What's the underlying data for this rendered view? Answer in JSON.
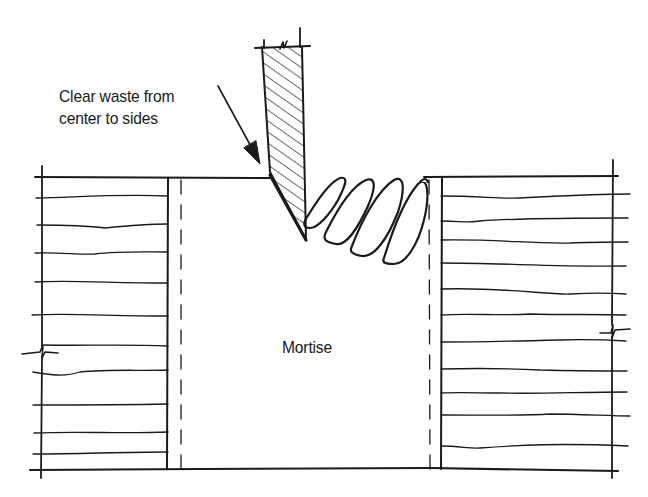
{
  "figure": {
    "type": "technical-illustration"
  },
  "labels": {
    "callout_line1": "Clear waste from",
    "callout_line2": "center to sides",
    "mortise": "Mortise"
  },
  "elements": {
    "chisel": {
      "hatched": true,
      "position": "left end of mortise, bevel facing right"
    },
    "waste_chips": {
      "count": 4,
      "shape": "curled shavings"
    },
    "left_stock": {
      "grain_lines": 10,
      "break_symbol": true
    },
    "right_stock": {
      "grain_lines": 12,
      "break_symbol": true
    },
    "mortise_walls": {
      "layout_lines": "dashed"
    }
  },
  "colors": {
    "ink": "#1a1a1a",
    "background": "#ffffff"
  }
}
